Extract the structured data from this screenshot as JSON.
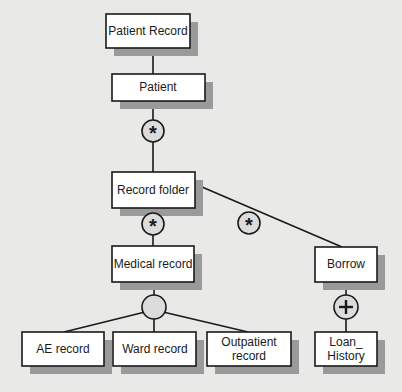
{
  "diagram": {
    "type": "hierarchy",
    "colors": {
      "background": "#e9e9e7",
      "box_fill": "#ffffff",
      "box_stroke": "#1a1a1a",
      "shadow": "#9a9a9a",
      "symbol_fill": "#dcdcdc"
    },
    "nodes": {
      "patient_record": {
        "label": "Patient Record"
      },
      "patient": {
        "label": "Patient"
      },
      "record_folder": {
        "label": "Record folder"
      },
      "medical_record": {
        "label": "Medical record"
      },
      "borrow": {
        "label": "Borrow"
      },
      "ae_record": {
        "label": "AE record"
      },
      "ward_record": {
        "label": "Ward record"
      },
      "outpatient_record": {
        "line1": "Outpatient",
        "line2": "record"
      },
      "loan_history": {
        "line1": "Loan_",
        "line2": "History"
      }
    },
    "symbols": {
      "patient_iteration": {
        "glyph": "*",
        "meaning": "iteration"
      },
      "medical_iteration": {
        "glyph": "*",
        "meaning": "iteration"
      },
      "borrow_iteration": {
        "glyph": "*",
        "meaning": "iteration"
      },
      "medical_selection": {
        "glyph": "",
        "meaning": "selection"
      },
      "loan_or": {
        "glyph": "+",
        "meaning": "optional/or"
      }
    },
    "edges": [
      [
        "patient_record",
        "patient"
      ],
      [
        "patient",
        "record_folder"
      ],
      [
        "record_folder",
        "medical_record"
      ],
      [
        "record_folder",
        "borrow"
      ],
      [
        "medical_record",
        "ae_record"
      ],
      [
        "medical_record",
        "ward_record"
      ],
      [
        "medical_record",
        "outpatient_record"
      ],
      [
        "borrow",
        "loan_history"
      ]
    ]
  }
}
